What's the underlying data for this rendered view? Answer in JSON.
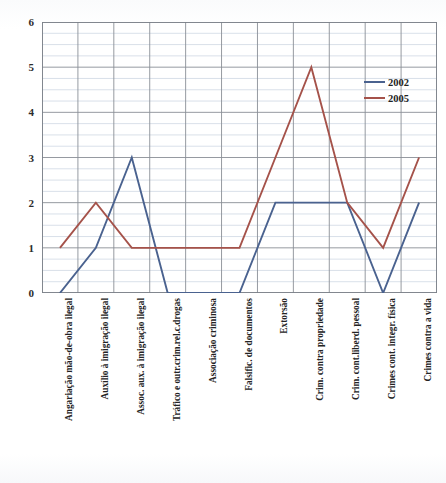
{
  "title": "",
  "legend": {
    "position": "right-inside",
    "entries": [
      {
        "label": "2002",
        "color": "#4a628f"
      },
      {
        "label": "2005",
        "color": "#a5524a"
      }
    ]
  },
  "axis": {
    "y_ticks": [
      "0",
      "1",
      "2",
      "3",
      "4",
      "5",
      "6"
    ],
    "y_min": 0,
    "y_max": 6,
    "minor_step": 0.25,
    "major_step": 1
  },
  "chart_data": {
    "type": "line",
    "title": "",
    "xlabel": "",
    "ylabel": "",
    "ylim": [
      0,
      6
    ],
    "grid": true,
    "legend_position": "right-inside",
    "categories": [
      "Angariação mão-de-obra ilegal",
      "Auxílio à imigração ilegal",
      "Assoc. aux. à imigração ilegal",
      "Tráfico e outr.crim.rel.c.drogas",
      "Associação criminosa",
      "Falsific. de documentos",
      "Extorsão",
      "Crim. contra propriedade",
      "Crim. cont.liberd. pessoal",
      "Crimes cont. integr. física",
      "Crimes contra a vida"
    ],
    "series": [
      {
        "name": "2002",
        "color": "#4a628f",
        "values": [
          0,
          1,
          3,
          0,
          0,
          0,
          2,
          2,
          2,
          0,
          2
        ]
      },
      {
        "name": "2005",
        "color": "#a5524a",
        "values": [
          1,
          2,
          1,
          1,
          1,
          1,
          3,
          5,
          2,
          1,
          3
        ]
      }
    ]
  }
}
